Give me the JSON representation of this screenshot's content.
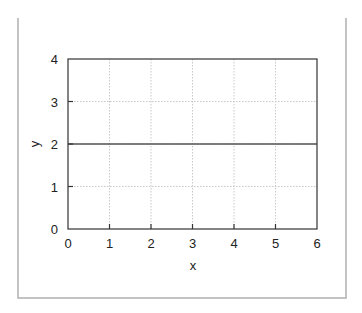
{
  "chart_data": {
    "type": "line",
    "title": "",
    "xlabel": "x",
    "ylabel": "y",
    "xlim": [
      0,
      6
    ],
    "ylim": [
      0,
      4
    ],
    "x_ticks": [
      "0",
      "1",
      "2",
      "3",
      "4",
      "5",
      "6"
    ],
    "y_ticks": [
      "0",
      "1",
      "2",
      "3",
      "4"
    ],
    "grid": true,
    "legend": null,
    "series": [
      {
        "name": "y = 2",
        "x": [
          0,
          6
        ],
        "y": [
          2,
          2
        ],
        "color": "#555555"
      }
    ]
  },
  "colors": {
    "frame": "#b0b0b0",
    "axes": "#333333",
    "grid": "#c8c8c8",
    "line": "#555555"
  }
}
